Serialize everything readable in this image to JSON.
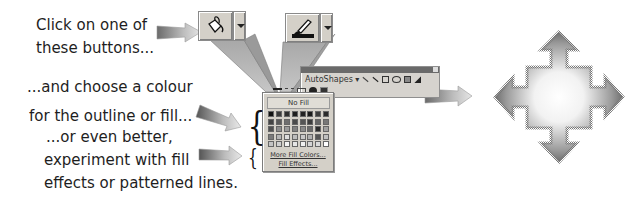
{
  "captions": {
    "step1": [
      "Click on one of",
      "these buttons..."
    ],
    "step2": [
      "...and choose a colour",
      "for the outline or fill..."
    ],
    "step3": [
      "...or even better,",
      "experiment with fill",
      "effects or patterned lines."
    ]
  },
  "toolbar_buttons": [
    {
      "name": "Fill Color",
      "icon": "paint-bucket-icon"
    },
    {
      "name": "Line Color",
      "icon": "paintbrush-icon"
    }
  ],
  "drawing_toolbar": {
    "autoshapes_label": "AutoShapes",
    "autoshapes_arrow": "▾",
    "tools": [
      "line-icon",
      "arrow-icon",
      "rectangle-icon",
      "oval-icon",
      "textbox-icon",
      "wordart-icon"
    ],
    "row2_tools": [
      "line-style-icon",
      "dash-style-icon",
      "arrow-style-icon",
      "shadow-icon",
      "3d-icon"
    ]
  },
  "palette": {
    "no_fill_label": "No Fill",
    "more_colors_label": "More Fill Colors...",
    "fill_effects_label": "Fill Effects...",
    "swatches": [
      "#111111",
      "#3a3a3a",
      "#2e2e2e",
      "#1e1e1e",
      "#222222",
      "#1a1a1a",
      "#3c3c3c",
      "#2a2a2a",
      "#444444",
      "#5a5a5a",
      "#6e6e6e",
      "#4a4a4a",
      "#555555",
      "#3d3d3d",
      "#666666",
      "#777777",
      "#505050",
      "#8c8c8c",
      "#9a9a9a",
      "#808080",
      "#8a8a8a",
      "#6a6a6a",
      "#2c2c2c",
      "#a0a0a0",
      "#7a7a7a",
      "#b5b5b5",
      "#dddddd",
      "#bdbdbd",
      "#c8c8c8",
      "#b0b0b0",
      "#555555",
      "#c0c0c0",
      "#c4c4c4",
      "#cfcfcf",
      "#f4f4f4",
      "#e6e6e6",
      "#f0f0f0",
      "#d4d4d4",
      "#d9d9d9",
      "#ffffff"
    ]
  },
  "result_shape": {
    "name": "four-way-arrow-gradient",
    "icon": "four-way-arrow-icon"
  },
  "pointer_arrows": [
    "arrow-to-buttons",
    "arrow-to-palette-colors",
    "arrow-to-palette-effects",
    "arrow-to-result"
  ]
}
